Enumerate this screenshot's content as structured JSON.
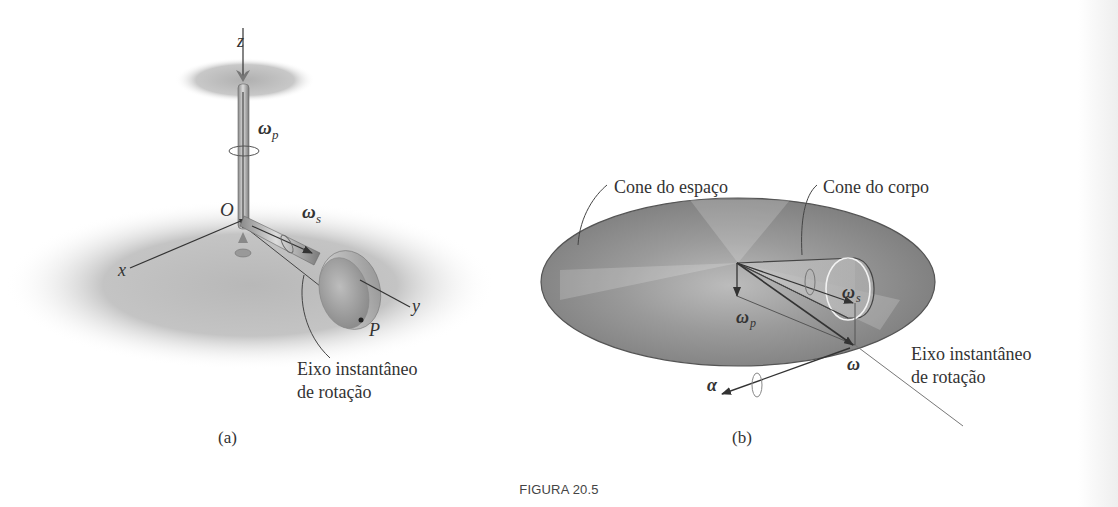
{
  "figure": {
    "caption": "FIGURA 20.5",
    "panel_a": {
      "label": "(a)",
      "axes": {
        "z": "z",
        "x": "x",
        "y": "y"
      },
      "origin": "O",
      "point": "P",
      "omega_p": "ω",
      "omega_p_sub": "p",
      "omega_s": "ω",
      "omega_s_sub": "s",
      "annotation_line1": "Eixo instantâneo",
      "annotation_line2": "de rotação"
    },
    "panel_b": {
      "label": "(b)",
      "space_cone_label": "Cone do espaço",
      "body_cone_label": "Cone do corpo",
      "omega_s": "ω",
      "omega_s_sub": "s",
      "omega_p": "ω",
      "omega_p_sub": "p",
      "omega": "ω",
      "alpha": "α",
      "annotation_line1": "Eixo instantâneo",
      "annotation_line2": "de rotação"
    }
  }
}
